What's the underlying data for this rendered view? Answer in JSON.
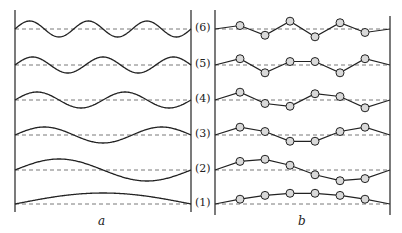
{
  "figure": {
    "panels": [
      {
        "id": "a",
        "label": "a",
        "description": "Continuous string standing-wave modes"
      },
      {
        "id": "b",
        "label": "b",
        "description": "Discrete beaded string (6 masses) normal modes"
      }
    ],
    "mode_labels": [
      "(6)",
      "(5)",
      "(4)",
      "(3)",
      "(2)",
      "(1)"
    ],
    "modes": [
      6,
      5,
      4,
      3,
      2,
      1
    ],
    "num_masses": 6,
    "colors": {
      "line": "#222222",
      "dashed": "#555555",
      "bead_fill": "#d9d9d9"
    }
  }
}
